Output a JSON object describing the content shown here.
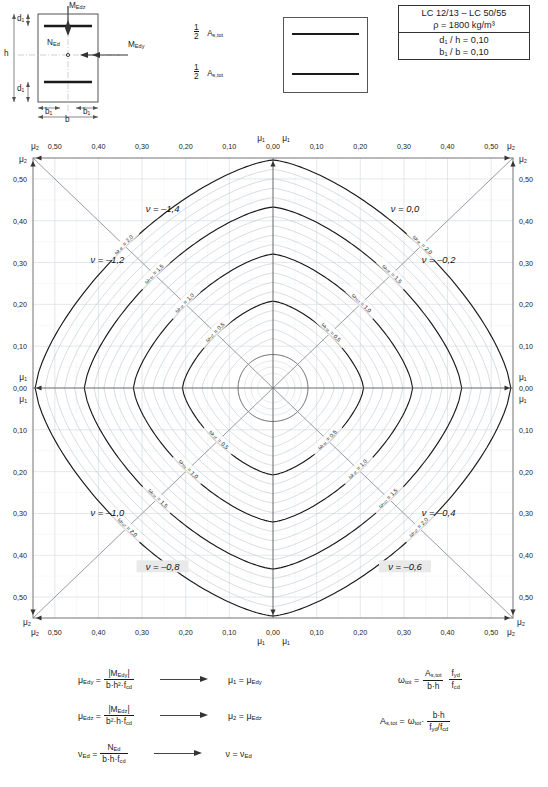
{
  "header": {
    "concrete_class": "LC 12/13 – LC 50/55",
    "density": "ρ  =  1800 kg/m³",
    "ratio_d1_h": "d₁ / h  =  0,10",
    "ratio_b1_b": "b₁ / b  =  0,10"
  },
  "section_sketch": {
    "label_MEdz": "M",
    "label_MEdz_sub": "Edz",
    "label_MEdy": "M",
    "label_MEdy_sub": "Edy",
    "label_NEd": "N",
    "label_NEd_sub": "Ed",
    "label_h": "h",
    "label_d1": "d₁",
    "label_b1": "b₁",
    "label_b": "b"
  },
  "legend": {
    "half_numerator": "1",
    "half_denominator": "2",
    "as_tot": "A",
    "as_tot_sub": "s,tot",
    "top_item": "½ A_s,tot",
    "bottom_item": "½ A_s,tot"
  },
  "formulas": {
    "left": [
      {
        "lhs_sym": "μ",
        "lhs_sub": "Edy",
        "num": "|M_Edy|",
        "num_sym": "M",
        "num_sub": "Edy",
        "den_sym": "b·h²·f",
        "den_sub": "cd",
        "res_sym": "μ",
        "res_sub": "1",
        "res_eq_sym": "μ",
        "res_eq_sub": "Edy"
      },
      {
        "lhs_sym": "μ",
        "lhs_sub": "Edz",
        "num": "|M_Edz|",
        "num_sym": "M",
        "num_sub": "Edz",
        "den_sym": "b²·h·f",
        "den_sub": "cd",
        "res_sym": "μ",
        "res_sub": "2",
        "res_eq_sym": "μ",
        "res_eq_sub": "Edz"
      },
      {
        "lhs_sym": "ν",
        "lhs_sub": "Ed",
        "num": "N_Ed",
        "num_sym": "N",
        "num_sub": "Ed",
        "den_sym": "b·h·f",
        "den_sub": "cd",
        "res_sym": "ν",
        "res_sub": "",
        "res_eq_sym": "ν",
        "res_eq_sub": "Ed"
      }
    ],
    "right": {
      "omega_sym": "ω",
      "omega_sub": "tot",
      "a_num_sym": "A",
      "a_num_sub": "s,tot",
      "a_den": "b·h",
      "f_num_sym": "f",
      "f_num_sub": "yd",
      "f_den_sym": "f",
      "f_den_sub": "cd",
      "as_lhs_sym": "A",
      "as_lhs_sub": "s,tot",
      "as_rhs_omega_sym": "ω",
      "as_rhs_omega_sub": "tot",
      "as_num": "b·h",
      "as_den": "f_yd / f_cd"
    }
  },
  "chart_data": {
    "type": "line",
    "xlabel": "μ₁  /  μ₂",
    "ylabel": "μ₂  /  μ₁",
    "grid": true,
    "axis_origin_label": "0,00",
    "tick_labels_half": [
      "0,00",
      "0,10",
      "0,20",
      "0,30",
      "0,40",
      "0,50"
    ],
    "tick_values_half": [
      0.0,
      0.1,
      0.2,
      0.3,
      0.4,
      0.5
    ],
    "axis_end_symbol": "μ₂",
    "axis_center_symbol": "μ₁",
    "top_axis_left_labels": [
      "μ₂",
      "0,50",
      "0,40",
      "0,30",
      "0,20",
      "0,10",
      "μ₁",
      "0,00"
    ],
    "top_axis_right_labels": [
      "μ₁",
      "0,00",
      "0,10",
      "0,20",
      "0,30",
      "0,40",
      "0,50",
      "μ₂"
    ],
    "bottom_axis_left_labels": [
      "μ₂",
      "0,50",
      "0,40",
      "0,30",
      "0,20",
      "0,10",
      "0,00"
    ],
    "bottom_axis_right_labels": [
      "0,00",
      "0,10",
      "0,20",
      "0,30",
      "0,40",
      "0,50",
      "μ₂"
    ],
    "left_axis_labels": [
      "μ₂",
      "0,50",
      "0,40",
      "0,30",
      "0,20",
      "0,10",
      "μ₁",
      "0,00",
      "μ₁",
      "0,10",
      "0,20",
      "0,30",
      "0,40",
      "0,50",
      "μ₂"
    ],
    "right_axis_labels": [
      "μ₂",
      "0,50",
      "0,40",
      "0,30",
      "0,20",
      "0,10",
      "μ₁",
      "0,00",
      "μ₁",
      "0,10",
      "0,20",
      "0,30",
      "0,40",
      "0,50",
      "μ₂"
    ],
    "nu_sectors": [
      {
        "label": "ν = –1,4",
        "x": 0.27,
        "y": 0.885,
        "highlight": false
      },
      {
        "label": "ν = –1,2",
        "x": 0.155,
        "y": 0.775,
        "highlight": false
      },
      {
        "label": "ν = 0,0",
        "x": 0.775,
        "y": 0.885,
        "highlight": false
      },
      {
        "label": "ν = –0,2",
        "x": 0.845,
        "y": 0.775,
        "highlight": false
      },
      {
        "label": "ν = –1,0",
        "x": 0.155,
        "y": 0.225,
        "highlight": false
      },
      {
        "label": "ν = –0,8",
        "x": 0.27,
        "y": 0.108,
        "highlight": true
      },
      {
        "label": "ν = –0,4",
        "x": 0.845,
        "y": 0.225,
        "highlight": false
      },
      {
        "label": "ν = –0,6",
        "x": 0.775,
        "y": 0.108,
        "highlight": true
      }
    ],
    "contour_variable": "ω_tot",
    "contour_levels_labeled": [
      0.5,
      1.0,
      1.5,
      2.0
    ],
    "contour_levels_all": [
      0.1,
      0.2,
      0.3,
      0.4,
      0.5,
      0.6,
      0.7,
      0.8,
      0.9,
      1.0,
      1.1,
      1.2,
      1.3,
      1.4,
      1.5,
      1.6,
      1.7,
      1.8,
      1.9,
      2.0
    ],
    "contour_label_template": "ωₜₒₜ = ",
    "series": [
      {
        "name": "ω_tot = 0,5",
        "level": 0.5,
        "bold": true
      },
      {
        "name": "ω_tot = 1,0",
        "level": 1.0,
        "bold": true
      },
      {
        "name": "ω_tot = 1,5",
        "level": 1.5,
        "bold": true
      },
      {
        "name": "ω_tot = 2,0",
        "level": 2.0,
        "bold": true
      }
    ],
    "quadrants": [
      {
        "id": "top-left",
        "nu_range": [
          "–1,4",
          "–1,2"
        ]
      },
      {
        "id": "top-right",
        "nu_range": [
          "0,0",
          "–0,2"
        ]
      },
      {
        "id": "bottom-left",
        "nu_range": [
          "–1,0",
          "–0,8"
        ]
      },
      {
        "id": "bottom-right",
        "nu_range": [
          "–0,4",
          "–0,6"
        ]
      }
    ]
  }
}
